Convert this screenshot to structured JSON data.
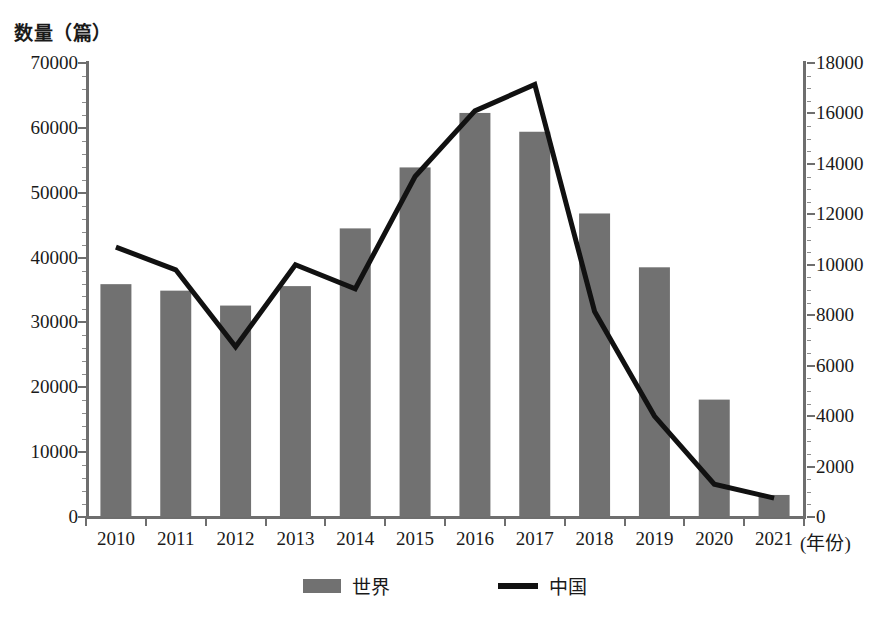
{
  "chart_data": {
    "type": "bar",
    "title": "",
    "ylabel": "数量（篇）",
    "xlabel": "(年份)",
    "grid": false,
    "legend_position": "bottom",
    "categories": [
      "2010",
      "2011",
      "2012",
      "2013",
      "2014",
      "2015",
      "2016",
      "2017",
      "2018",
      "2019",
      "2020",
      "2021"
    ],
    "left_axis": {
      "label": "数量（篇）",
      "ylim": [
        0,
        70000
      ],
      "ticks": [
        0,
        10000,
        20000,
        30000,
        40000,
        50000,
        60000,
        70000
      ],
      "tick_labels": [
        "0",
        "10000",
        "20000",
        "30000",
        "40000",
        "50000",
        "60000",
        "70000"
      ]
    },
    "right_axis": {
      "ylim": [
        0,
        18000
      ],
      "ticks": [
        0,
        2000,
        4000,
        6000,
        8000,
        10000,
        12000,
        14000,
        16000,
        18000
      ],
      "tick_labels": [
        "0",
        "2000",
        "4000",
        "6000",
        "8000",
        "10000",
        "12000",
        "14000",
        "16000",
        "18000"
      ]
    },
    "series": [
      {
        "name": "世界",
        "type": "bar",
        "axis": "left",
        "color": "#717171",
        "values": [
          35900,
          34900,
          32600,
          35600,
          44500,
          53900,
          62300,
          59400,
          46800,
          38500,
          18100,
          3400
        ]
      },
      {
        "name": "中国",
        "type": "line",
        "axis": "right",
        "color": "#111111",
        "values": [
          10700,
          9800,
          6750,
          10000,
          9050,
          13500,
          16100,
          17150,
          8150,
          4000,
          1300,
          750
        ]
      }
    ]
  },
  "legend": {
    "items": [
      {
        "label": "世界",
        "marker": "bar-swatch",
        "color": "#717171"
      },
      {
        "label": "中国",
        "marker": "line-swatch",
        "color": "#111111"
      }
    ]
  },
  "axis_titles": {
    "left": "数量（篇）",
    "x_unit": "(年份)"
  }
}
